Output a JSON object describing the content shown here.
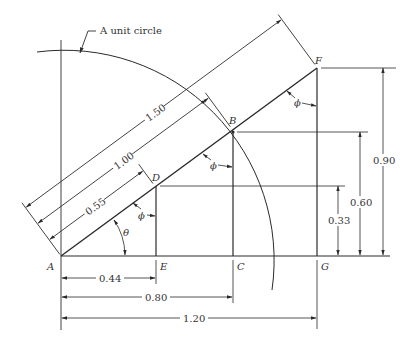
{
  "title_annotation": "A unit circle",
  "points": {
    "A": "A",
    "B": "B",
    "C": "C",
    "D": "D",
    "E": "E",
    "F": "F",
    "G": "G"
  },
  "angles": {
    "theta": "θ",
    "phi": "ϕ"
  },
  "diagonal_dims": {
    "d150": "1.50",
    "d100": "1.00",
    "d055": "0.55"
  },
  "horizontal_dims": {
    "h044": "0.44",
    "h080": "0.80",
    "h120": "1.20"
  },
  "vertical_dims": {
    "v033": "0.33",
    "v060": "0.60",
    "v090": "0.90"
  },
  "colors": {
    "ink": "#2a2a2a",
    "background": "#ffffff"
  }
}
